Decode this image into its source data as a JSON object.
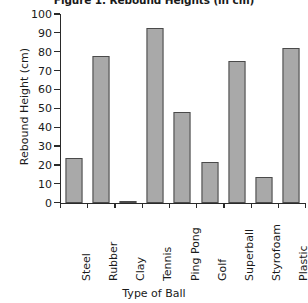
{
  "chart_data": {
    "type": "bar",
    "title": "Figure 1. Rebound Heights (in cm)",
    "xlabel": "Type of Ball",
    "ylabel": "Rebound Height (cm)",
    "categories": [
      "Steel",
      "Rubber",
      "Clay",
      "Tennis",
      "Ping Pong",
      "Golf",
      "Superball",
      "Styrofoam",
      "Plastic"
    ],
    "values": [
      24,
      78,
      1,
      93,
      48,
      22,
      75,
      14,
      82
    ],
    "ylim": [
      0,
      100
    ],
    "ytick_step": 10,
    "yticks": [
      0,
      10,
      20,
      30,
      40,
      50,
      60,
      70,
      80,
      90,
      100
    ],
    "ytick_labels": [
      "0",
      "10",
      "20",
      "30",
      "40",
      "50",
      "60",
      "70",
      "80",
      "90",
      "100"
    ],
    "grid": false,
    "legend": false,
    "bar_fill_color": "#a9a9a9",
    "bar_edge_color": "#4a4a4a",
    "axis_color": "#2a2a2a",
    "background_color": "#ffffff",
    "xtick_label_rotation": 90
  }
}
